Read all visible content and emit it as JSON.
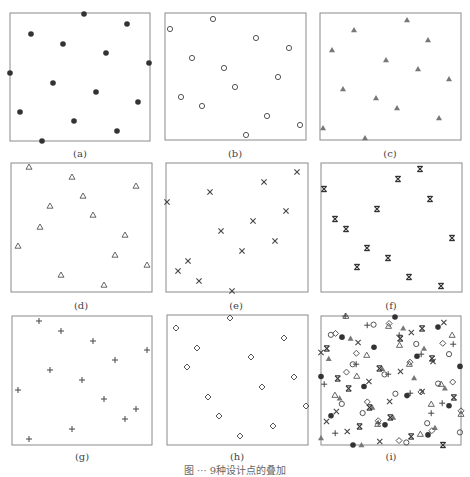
{
  "chart_data": [
    {
      "type": "scatter",
      "panel": "a",
      "label": "(a)",
      "marker": "filled-circle",
      "color": "#333333",
      "box": [
        10,
        13,
        150,
        141
      ],
      "points": [
        [
          84,
          14
        ],
        [
          127,
          24
        ],
        [
          31,
          34
        ],
        [
          63,
          44
        ],
        [
          106,
          53
        ],
        [
          149,
          63
        ],
        [
          10,
          73
        ],
        [
          53,
          83
        ],
        [
          96,
          92
        ],
        [
          138,
          102
        ],
        [
          20,
          112
        ],
        [
          74,
          121
        ],
        [
          117,
          131
        ],
        [
          42,
          141
        ]
      ]
    },
    {
      "type": "scatter",
      "panel": "b",
      "label": "(b)",
      "marker": "open-circle",
      "color": "#555555",
      "box": [
        165,
        13,
        306,
        140
      ],
      "points": [
        [
          213,
          19
        ],
        [
          170,
          29
        ],
        [
          256,
          38
        ],
        [
          289,
          48
        ],
        [
          192,
          58
        ],
        [
          224,
          68
        ],
        [
          278,
          77
        ],
        [
          235,
          87
        ],
        [
          181,
          97
        ],
        [
          202,
          106
        ],
        [
          267,
          116
        ],
        [
          300,
          125
        ],
        [
          246,
          135
        ]
      ]
    },
    {
      "type": "scatter",
      "panel": "c",
      "label": "(c)",
      "marker": "filled-triangle",
      "color": "#777777",
      "box": [
        320,
        13,
        461,
        140
      ],
      "points": [
        [
          407,
          20
        ],
        [
          354,
          30
        ],
        [
          428,
          40
        ],
        [
          332,
          50
        ],
        [
          386,
          60
        ],
        [
          418,
          69
        ],
        [
          449,
          79
        ],
        [
          343,
          89
        ],
        [
          376,
          98
        ],
        [
          397,
          108
        ],
        [
          439,
          118
        ],
        [
          323,
          128
        ],
        [
          365,
          138
        ]
      ]
    },
    {
      "type": "scatter",
      "panel": "d",
      "label": "(d)",
      "marker": "open-triangle",
      "color": "#555555",
      "box": [
        11,
        163,
        152,
        292
      ],
      "points": [
        [
          29,
          167
        ],
        [
          72,
          177
        ],
        [
          136,
          186
        ],
        [
          83,
          196
        ],
        [
          50,
          206
        ],
        [
          93,
          215
        ],
        [
          40,
          227
        ],
        [
          125,
          235
        ],
        [
          18,
          246
        ],
        [
          115,
          255
        ],
        [
          147,
          265
        ],
        [
          61,
          275
        ],
        [
          104,
          285
        ]
      ]
    },
    {
      "type": "scatter",
      "panel": "e",
      "label": "(e)",
      "marker": "x",
      "color": "#444444",
      "box": [
        166,
        163,
        308,
        292
      ],
      "points": [
        [
          297,
          172
        ],
        [
          264,
          182
        ],
        [
          210,
          192
        ],
        [
          167,
          202
        ],
        [
          286,
          211
        ],
        [
          253,
          221
        ],
        [
          221,
          231
        ],
        [
          275,
          241
        ],
        [
          242,
          251
        ],
        [
          188,
          261
        ],
        [
          178,
          271
        ],
        [
          199,
          281
        ],
        [
          232,
          291
        ]
      ]
    },
    {
      "type": "scatter",
      "panel": "f",
      "label": "(f)",
      "marker": "barred-x",
      "color": "#333333",
      "box": [
        321,
        163,
        462,
        292
      ],
      "points": [
        [
          420,
          169
        ],
        [
          398,
          179
        ],
        [
          324,
          189
        ],
        [
          430,
          199
        ],
        [
          377,
          209
        ],
        [
          335,
          219
        ],
        [
          346,
          229
        ],
        [
          452,
          238
        ],
        [
          367,
          248
        ],
        [
          388,
          258
        ],
        [
          357,
          267
        ],
        [
          409,
          277
        ],
        [
          441,
          286
        ]
      ]
    },
    {
      "type": "scatter",
      "panel": "g",
      "label": "(g)",
      "marker": "plus",
      "color": "#444444",
      "box": [
        12,
        316,
        152,
        445
      ],
      "points": [
        [
          39,
          321
        ],
        [
          61,
          331
        ],
        [
          93,
          341
        ],
        [
          147,
          350
        ],
        [
          115,
          360
        ],
        [
          50,
          370
        ],
        [
          82,
          380
        ],
        [
          18,
          390
        ],
        [
          104,
          399
        ],
        [
          136,
          409
        ],
        [
          125,
          419
        ],
        [
          72,
          429
        ],
        [
          29,
          439
        ]
      ]
    },
    {
      "type": "scatter",
      "panel": "h",
      "label": "(h)",
      "marker": "open-diamond",
      "color": "#555555",
      "box": [
        167,
        315,
        308,
        445
      ],
      "points": [
        [
          230,
          318
        ],
        [
          176,
          328
        ],
        [
          284,
          338
        ],
        [
          197,
          348
        ],
        [
          251,
          357
        ],
        [
          187,
          367
        ],
        [
          294,
          377
        ],
        [
          262,
          387
        ],
        [
          208,
          397
        ],
        [
          306,
          406
        ],
        [
          219,
          416
        ],
        [
          273,
          426
        ],
        [
          240,
          436
        ]
      ]
    },
    {
      "type": "scatter",
      "panel": "i",
      "label": "(i)",
      "marker": "superposition of (a)–(h)",
      "color": "#444444",
      "box": [
        321,
        316,
        461,
        445
      ],
      "points": "overlay of all points from panels (a)–(h)"
    }
  ],
  "panels": {
    "a": {
      "label": "(a)"
    },
    "b": {
      "label": "(b)"
    },
    "c": {
      "label": "(c)"
    },
    "d": {
      "label": "(d)"
    },
    "e": {
      "label": "(e)"
    },
    "f": {
      "label": "(f)"
    },
    "g": {
      "label": "(g)"
    },
    "h": {
      "label": "(h)"
    },
    "i": {
      "label": "(i)"
    }
  },
  "caption": "图 ··· 9种设计点的叠加"
}
